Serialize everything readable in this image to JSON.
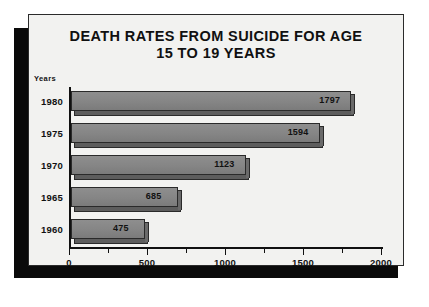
{
  "chart_data": {
    "type": "bar",
    "orientation": "horizontal",
    "title_line1": "DEATH RATES FROM SUICIDE FOR AGE",
    "title_line2": "15 TO 19 YEARS",
    "ylabel": "Years",
    "xlabel": "",
    "categories": [
      "1980",
      "1975",
      "1970",
      "1965",
      "1960"
    ],
    "values": [
      1797,
      1594,
      1123,
      685,
      475
    ],
    "value_labels": [
      "1797",
      "1594",
      "1123",
      "685",
      "475"
    ],
    "xlim": [
      0,
      2000
    ],
    "xticks": [
      0,
      500,
      1000,
      1500,
      2000
    ],
    "xtick_labels": [
      "0",
      "500",
      "1000",
      "1500",
      "2000"
    ],
    "xminor_ticks": [
      250,
      750,
      1250,
      1750
    ],
    "grid": false,
    "legend": null,
    "colors": {
      "bar_face": "#878787",
      "bar_edge": "#2a2a2a",
      "bar_shadow": "#5d5d5d",
      "card_background": "#f2f2f0",
      "drop_shadow": "#0a0a0a",
      "text": "#111111"
    }
  }
}
